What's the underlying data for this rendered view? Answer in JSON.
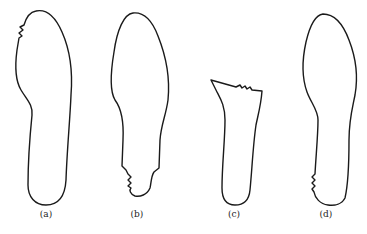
{
  "figure": {
    "panels": [
      {
        "id": "a",
        "label": "(a)",
        "description": "Full insole outline with serrated notch near upper-left toe edge"
      },
      {
        "id": "b",
        "label": "(b)",
        "description": "Insole outline with heel section cut and serrated edge at lower-left"
      },
      {
        "id": "c",
        "label": "(c)",
        "description": "Heel/midfoot fragment with serrated top cut edge"
      },
      {
        "id": "d",
        "label": "(d)",
        "description": "Full insole outline with serrated notch near lower-left heel edge"
      }
    ]
  }
}
